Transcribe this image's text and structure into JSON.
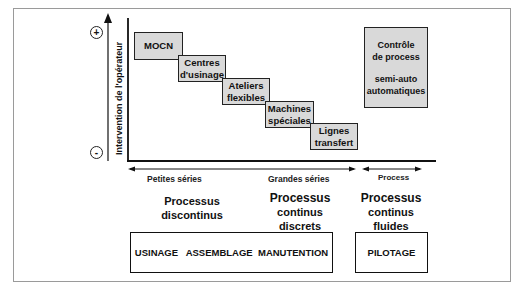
{
  "diagram": {
    "y_axis": {
      "label": "Intervention de l'opérateur",
      "top_marker": "+",
      "bottom_marker": "-"
    },
    "steps": [
      {
        "label": "MOCN"
      },
      {
        "label_line1": "Centres",
        "label_line2": "d'usinage"
      },
      {
        "label_line1": "Ateliers",
        "label_line2": "flexibles"
      },
      {
        "label_line1": "Machines",
        "label_line2": "spéciales"
      },
      {
        "label_line1": "Lignes",
        "label_line2": "transfert"
      }
    ],
    "process_box": {
      "line1": "Contrôle",
      "line2": "de process",
      "line3": "semi-auto",
      "line4": "automatiques"
    },
    "x_axis": {
      "left_label": "Petites séries",
      "right_label": "Grandes séries",
      "process_label": "Process"
    },
    "categories": [
      {
        "line1": "Processus",
        "line2": "discontinus"
      },
      {
        "line1": "Processus",
        "line2": "continus",
        "line3": "discrets"
      },
      {
        "line1": "Processus",
        "line2": "continus",
        "line3": "fluides"
      }
    ],
    "bottom_boxes": {
      "left": "USINAGE   ASSEMBLAGE  MANUTENTION",
      "right": "PILOTAGE"
    }
  }
}
